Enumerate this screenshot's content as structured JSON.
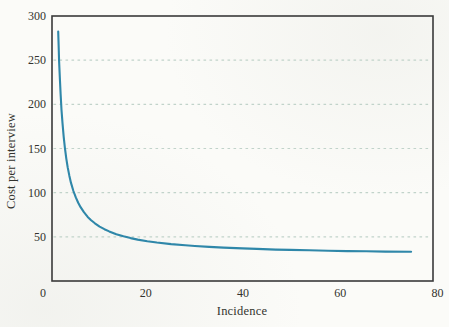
{
  "figure": {
    "background": "#fbfbf8",
    "frame_color": "#3a3a3a",
    "grid_color": "#c1d3ca",
    "curve_color": "#2f87a9",
    "text_color": "#33332e"
  },
  "chart_data": {
    "type": "line",
    "title": "",
    "xlabel": "Incidence",
    "ylabel": "Cost per interview",
    "xlim": [
      0,
      80
    ],
    "ylim": [
      0,
      300
    ],
    "x_ticks": [
      0,
      20,
      40,
      60,
      80
    ],
    "y_ticks": [
      300,
      250,
      200,
      150,
      100,
      50
    ],
    "grid_values": [
      250,
      200,
      150,
      100,
      50
    ],
    "grid_style": "horizontal-dashed",
    "legend": "none",
    "series": [
      {
        "name": "cost-per-interview-curve",
        "color": "#2f87a9",
        "points": [
          [
            1.3,
            282.4
          ],
          [
            1.4,
            264.3
          ],
          [
            1.5,
            248.6
          ],
          [
            1.65,
            228.6
          ],
          [
            1.8,
            211.9
          ],
          [
            2.0,
            193.6
          ],
          [
            2.2,
            178.6
          ],
          [
            2.45,
            163.3
          ],
          [
            2.7,
            150.8
          ],
          [
            3.0,
            138.6
          ],
          [
            3.3,
            128.6
          ],
          [
            3.65,
            119.0
          ],
          [
            4.0,
            111.1
          ],
          [
            4.5,
            101.9
          ],
          [
            5.0,
            94.6
          ],
          [
            5.5,
            88.6
          ],
          [
            6.0,
            83.6
          ],
          [
            6.7,
            77.9
          ],
          [
            7.5,
            72.6
          ],
          [
            8.2,
            68.8
          ],
          [
            9.0,
            65.3
          ],
          [
            10.0,
            61.6
          ],
          [
            11.0,
            58.6
          ],
          [
            12.0,
            56.1
          ],
          [
            13.5,
            53.0
          ],
          [
            15.0,
            50.6
          ],
          [
            16.5,
            48.6
          ],
          [
            18.0,
            46.9
          ],
          [
            20.0,
            45.1
          ],
          [
            22.0,
            43.6
          ],
          [
            25.0,
            41.8
          ],
          [
            28.0,
            40.4
          ],
          [
            30.0,
            39.6
          ],
          [
            33.0,
            38.6
          ],
          [
            36.0,
            37.8
          ],
          [
            40.0,
            36.9
          ],
          [
            43.0,
            36.3
          ],
          [
            47.0,
            35.6
          ],
          [
            50.0,
            35.2
          ],
          [
            54.0,
            34.7
          ],
          [
            58.0,
            34.3
          ],
          [
            62.0,
            33.9
          ],
          [
            66.0,
            33.6
          ],
          [
            70.0,
            33.3
          ],
          [
            75.4,
            33.0
          ]
        ]
      }
    ]
  }
}
